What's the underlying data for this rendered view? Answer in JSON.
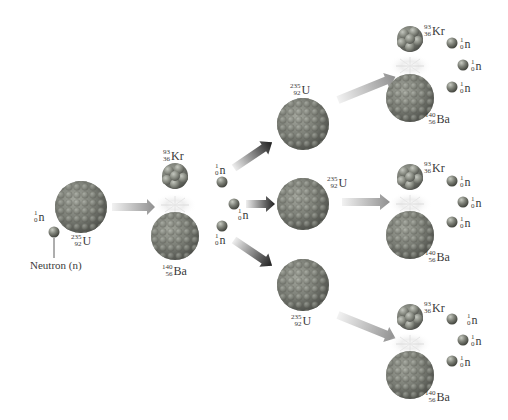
{
  "diagram": {
    "colors": {
      "nucleus": "#7d8078",
      "nucleus_highlight": "#b5b8b0",
      "nucleus_shadow": "#4c4e49",
      "arrow_light": "#d6d6d6",
      "arrow_dark": "#2a2a2a",
      "arrow_gray": "#9a9a9a",
      "label": "#3a3a3a"
    },
    "initial": {
      "neutron": {
        "mass": "1",
        "number": "0",
        "symbol": "n"
      },
      "neutron_caption": "Neutron (n)",
      "target": {
        "mass": "235",
        "number": "92",
        "symbol": "U"
      }
    },
    "first_fission": {
      "kr": {
        "mass": "93",
        "number": "36",
        "symbol": "Kr"
      },
      "ba": {
        "mass": "140",
        "number": "56",
        "symbol": "Ba"
      },
      "neutrons": [
        {
          "mass": "1",
          "number": "0",
          "symbol": "n"
        },
        {
          "mass": "1",
          "number": "0",
          "symbol": "n"
        },
        {
          "mass": "1",
          "number": "0",
          "symbol": "n"
        }
      ]
    },
    "second_targets": [
      {
        "mass": "235",
        "number": "92",
        "symbol": "U"
      },
      {
        "mass": "235",
        "number": "92",
        "symbol": "U"
      },
      {
        "mass": "235",
        "number": "92",
        "symbol": "U"
      }
    ],
    "second_fissions": [
      {
        "kr": {
          "mass": "93",
          "number": "36",
          "symbol": "Kr"
        },
        "ba": {
          "mass": "140",
          "number": "56",
          "symbol": "Ba"
        },
        "neutrons": [
          {
            "mass": "1",
            "number": "0",
            "symbol": "n"
          },
          {
            "mass": "1",
            "number": "0",
            "symbol": "n"
          },
          {
            "mass": "1",
            "number": "0",
            "symbol": "n"
          }
        ]
      },
      {
        "kr": {
          "mass": "93",
          "number": "36",
          "symbol": "Kr"
        },
        "ba": {
          "mass": "140",
          "number": "56",
          "symbol": "Ba"
        },
        "neutrons": [
          {
            "mass": "1",
            "number": "0",
            "symbol": "n"
          },
          {
            "mass": "1",
            "number": "0",
            "symbol": "n"
          },
          {
            "mass": "1",
            "number": "0",
            "symbol": "n"
          }
        ]
      },
      {
        "kr": {
          "mass": "93",
          "number": "36",
          "symbol": "Kr"
        },
        "ba": {
          "mass": "140",
          "number": "56",
          "symbol": "Ba"
        },
        "neutrons": [
          {
            "mass": "1",
            "number": "0",
            "symbol": "n"
          },
          {
            "mass": "1",
            "number": "0",
            "symbol": "n"
          },
          {
            "mass": "1",
            "number": "0",
            "symbol": "n"
          }
        ]
      }
    ]
  }
}
